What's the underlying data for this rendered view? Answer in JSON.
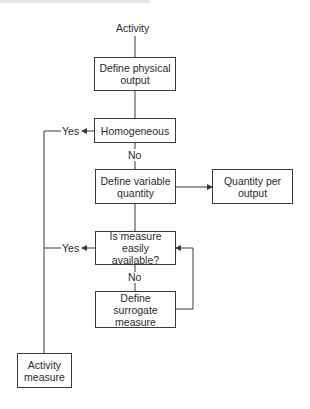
{
  "diagram": {
    "type": "flowchart",
    "start_label": "Activity",
    "nodes": {
      "define_physical_output": "Define physical output",
      "homogeneous": "Homogeneous",
      "define_variable_quantity": "Define variable quantity",
      "quantity_per_output": "Quantity per output",
      "is_measure_available": "Is measure easily available?",
      "define_surrogate_measure": "Define surrogate measure",
      "activity_measure": "Activity measure"
    },
    "labels": {
      "yes_homogeneous": "Yes",
      "no_homogeneous": "No",
      "yes_available": "Yes",
      "no_available": "No"
    },
    "colors": {
      "line": "#3a3a3a",
      "text": "#2a2a2a",
      "background": "#ffffff"
    }
  }
}
